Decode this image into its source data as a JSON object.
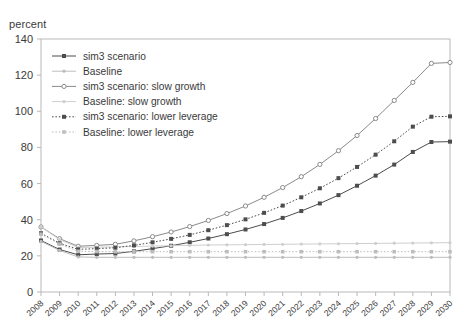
{
  "axis": {
    "unit_label": "percent",
    "y_ticks": [
      "0",
      "20",
      "40",
      "60",
      "80",
      "100",
      "120",
      "140"
    ],
    "x_ticks": [
      "2008",
      "2009",
      "2010",
      "2011",
      "2012",
      "2013",
      "2014",
      "2015",
      "2016",
      "2017",
      "2018",
      "2019",
      "2020",
      "2021",
      "2022",
      "2023",
      "2024",
      "2025",
      "2026",
      "2027",
      "2028",
      "2029",
      "2030"
    ]
  },
  "legend": {
    "items": [
      {
        "label": "sim3 scenario",
        "marker": "filled-diamond",
        "line": "solid",
        "color": "#4d4d4d"
      },
      {
        "label": "Baseline",
        "marker": "light-dot",
        "line": "solid",
        "color": "#bdbdbd"
      },
      {
        "label": "sim3 scenario: slow growth",
        "marker": "open-circle",
        "line": "solid",
        "color": "#8a8a8a"
      },
      {
        "label": "Baseline: slow growth",
        "marker": "light-dot",
        "line": "solid",
        "color": "#cfcfcf"
      },
      {
        "label": "sim3 scenario: lower leverage",
        "marker": "filled-square",
        "line": "dotted",
        "color": "#4d4d4d"
      },
      {
        "label": "Baseline: lower leverage",
        "marker": "light-square",
        "line": "dotted",
        "color": "#bdbdbd"
      }
    ]
  },
  "chart_data": {
    "type": "line",
    "title": "",
    "xlabel": "",
    "ylabel": "percent",
    "ylim": [
      0,
      140
    ],
    "ytick_step": 20,
    "grid": false,
    "legend_position": "top-left-inside",
    "x": [
      "2008",
      "2009",
      "2010",
      "2011",
      "2012",
      "2013",
      "2014",
      "2015",
      "2016",
      "2017",
      "2018",
      "2019",
      "2020",
      "2021",
      "2022",
      "2023",
      "2024",
      "2025",
      "2026",
      "2027",
      "2028",
      "2029",
      "2030"
    ],
    "series": [
      {
        "name": "sim3 scenario",
        "marker": "filled-diamond",
        "line": "solid",
        "color": "#4d4d4d",
        "values": [
          28.5,
          23.5,
          20.6,
          21.0,
          21.3,
          22.5,
          24.0,
          25.6,
          27.5,
          29.6,
          32.0,
          34.6,
          37.6,
          41.0,
          44.8,
          49.0,
          53.6,
          58.8,
          64.4,
          70.5,
          77.5,
          83.0,
          83.2
        ]
      },
      {
        "name": "Baseline",
        "marker": "light-dot",
        "line": "solid",
        "color": "#bdbdbd",
        "values": [
          28.0,
          23.0,
          19.4,
          19.2,
          19.2,
          19.2,
          19.2,
          19.2,
          19.2,
          19.2,
          19.2,
          19.2,
          19.2,
          19.2,
          19.2,
          19.2,
          19.2,
          19.2,
          19.2,
          19.2,
          19.2,
          19.2,
          19.2
        ]
      },
      {
        "name": "sim3 scenario: slow growth",
        "marker": "open-circle",
        "line": "solid",
        "color": "#8a8a8a",
        "values": [
          36.0,
          29.5,
          25.3,
          25.8,
          26.4,
          28.3,
          30.6,
          33.2,
          36.2,
          39.6,
          43.4,
          47.6,
          52.4,
          57.8,
          63.8,
          70.6,
          78.2,
          86.6,
          96.0,
          106.0,
          116.0,
          126.5,
          127.0
        ]
      },
      {
        "name": "Baseline: slow growth",
        "marker": "light-dot",
        "line": "solid",
        "color": "#cfcfcf",
        "values": [
          36.0,
          29.0,
          24.6,
          24.8,
          25.0,
          25.2,
          25.4,
          25.6,
          25.8,
          26.0,
          26.1,
          26.2,
          26.3,
          26.4,
          26.5,
          26.6,
          26.7,
          26.8,
          26.9,
          27.0,
          27.1,
          27.2,
          27.3
        ]
      },
      {
        "name": "sim3 scenario: lower leverage",
        "marker": "filled-square",
        "line": "dotted",
        "color": "#4d4d4d",
        "values": [
          32.5,
          27.0,
          23.6,
          24.0,
          24.5,
          25.8,
          27.5,
          29.4,
          31.6,
          34.2,
          37.0,
          40.2,
          43.8,
          47.8,
          52.4,
          57.4,
          63.0,
          69.2,
          76.0,
          83.4,
          91.5,
          97.0,
          97.2
        ]
      },
      {
        "name": "Baseline: lower leverage",
        "marker": "light-square",
        "line": "dotted",
        "color": "#bdbdbd",
        "values": [
          32.0,
          26.5,
          22.5,
          22.4,
          22.3,
          22.3,
          22.3,
          22.3,
          22.3,
          22.3,
          22.3,
          22.3,
          22.3,
          22.3,
          22.3,
          22.3,
          22.3,
          22.3,
          22.3,
          22.3,
          22.3,
          22.3,
          22.3
        ]
      }
    ]
  }
}
